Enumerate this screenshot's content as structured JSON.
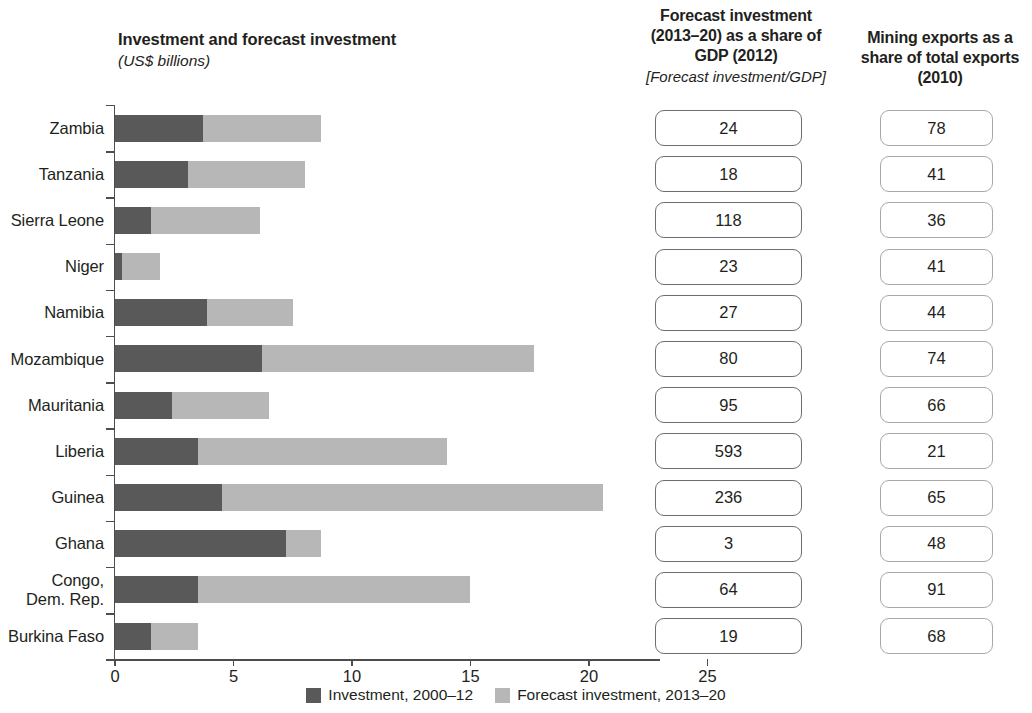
{
  "headers": {
    "chart_title_line1": "Investment and forecast investment",
    "chart_title_line2": "(US$ billions)",
    "gdp_line1": "Forecast investment",
    "gdp_line2": "(2013–20) as a share of",
    "gdp_line3": "GDP (2012)",
    "gdp_line4": "[Forecast investment/GDP]",
    "mining_line1": "Mining exports as a",
    "mining_line2": "share of total exports",
    "mining_line3": "(2010)"
  },
  "legend": {
    "items": [
      {
        "label": "Investment, 2000–12",
        "color": "#595959",
        "icon": "square-swatch-dark"
      },
      {
        "label": "Forecast investment, 2013–20",
        "color": "#b7b7b7",
        "icon": "square-swatch-light"
      }
    ]
  },
  "axis": {
    "xlabel": "",
    "ticks": [
      "0",
      "5",
      "10",
      "15",
      "20",
      "25"
    ],
    "tick_values": [
      0,
      5,
      10,
      15,
      20,
      25
    ],
    "xmin": 0,
    "xmax": 23.0
  },
  "chart_data": {
    "type": "bar",
    "orientation": "horizontal",
    "stacked": true,
    "title": "Investment and forecast investment",
    "subtitle": "(US$ billions)",
    "xlabel": "US$ billions",
    "ylabel": "",
    "xlim": [
      0,
      23.0
    ],
    "grid": false,
    "legend_position": "bottom",
    "categories": [
      "Zambia",
      "Tanzania",
      "Sierra Leone",
      "Niger",
      "Namibia",
      "Mozambique",
      "Mauritania",
      "Liberia",
      "Guinea",
      "Ghana",
      "Congo,\nDem. Rep.",
      "Burkina Faso"
    ],
    "series": [
      {
        "name": "Investment, 2000–12",
        "color": "#595959",
        "values": [
          3.7,
          3.1,
          1.5,
          0.3,
          3.9,
          6.2,
          2.4,
          3.5,
          4.5,
          7.2,
          3.5,
          1.5
        ]
      },
      {
        "name": "Forecast investment, 2013–20",
        "color": "#b7b7b7",
        "values": [
          5.0,
          4.9,
          4.6,
          1.6,
          3.6,
          11.5,
          4.1,
          10.5,
          16.1,
          1.5,
          11.5,
          2.0
        ]
      }
    ],
    "totals": [
      8.7,
      8.0,
      6.1,
      1.9,
      7.5,
      17.7,
      6.5,
      14.0,
      20.6,
      8.7,
      15.0,
      3.5
    ],
    "extra_columns": [
      {
        "header": "Forecast investment (2013–20) as a share of GDP (2012) [Forecast investment/GDP]",
        "values": [
          "24",
          "18",
          "118",
          "23",
          "27",
          "80",
          "95",
          "593",
          "236",
          "3",
          "64",
          "19"
        ]
      },
      {
        "header": "Mining exports as a share of total exports (2010)",
        "values": [
          "78",
          "41",
          "36",
          "41",
          "44",
          "74",
          "66",
          "21",
          "65",
          "48",
          "91",
          "68"
        ]
      }
    ]
  }
}
